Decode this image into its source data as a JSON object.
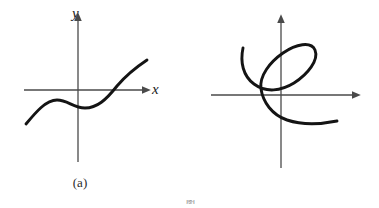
{
  "figure": {
    "background": "#ffffff",
    "ink_color": "#1a1a1a",
    "axis_color": "#4a4a4a",
    "width": 379,
    "height": 208,
    "bottom_caption_stub": "图"
  },
  "panels": [
    {
      "id": "a",
      "caption": "(a)",
      "x_axis_label": "x",
      "y_axis_label": "y",
      "description": "cubic-like increasing curve with one local maximum and one local minimum",
      "origin": {
        "x": 78,
        "y": 90
      },
      "x_axis": {
        "from_x": 24,
        "to_x": 148,
        "y": 90,
        "arrow": "right"
      },
      "y_axis": {
        "x": 78,
        "from_y": 162,
        "to_y": 15,
        "arrow": "up"
      },
      "curve_path": "M 26 124 C 36 112, 46 100, 57 100 C 68 100, 73 108, 85 108 C 97 108, 106 100, 117 86 C 128 73, 138 66, 147 60"
    },
    {
      "id": "b",
      "caption": "(b)",
      "x_axis_label": "x",
      "y_axis_label": "y",
      "description": "self-intersecting spiral loop curve, open at both ends",
      "origin": {
        "x": 281,
        "y": 95
      },
      "x_axis": {
        "from_x": 211,
        "to_x": 358,
        "y": 95,
        "arrow": "right"
      },
      "y_axis": {
        "x": 281,
        "from_y": 168,
        "to_y": 17,
        "arrow": "up"
      },
      "curve_path": "M 243 48 C 240 62, 243 76, 254 84 C 266 93, 281 91, 294 83 C 308 74, 319 60, 315 50 C 311 41, 296 44, 283 53 C 270 62, 259 76, 261 89 C 263 102, 272 115, 287 120 C 302 125, 322 124, 337 121"
    }
  ],
  "chart_data": {
    "type": "line",
    "title": "",
    "xlabel": "x",
    "ylabel": "y",
    "subplots": [
      {
        "label": "(a)",
        "curve_type": "cubic",
        "monotonic": false,
        "features": [
          "local maximum left of y-axis",
          "local minimum right of y-axis",
          "rises to upper right",
          "falls to lower left"
        ],
        "approx_points": [
          [
            -5.2,
            -3.4
          ],
          [
            -2.1,
            1.0
          ],
          [
            0.0,
            -1.6
          ],
          [
            0.7,
            -1.8
          ],
          [
            3.9,
            0.4
          ],
          [
            6.9,
            3.0
          ]
        ]
      },
      {
        "label": "(b)",
        "curve_type": "self-intersecting spiral",
        "monotonic": false,
        "features": [
          "tilted elliptical loop above x-axis",
          "two crossings of the y-axis",
          "open tail at upper left",
          "open tail at lower right"
        ],
        "approx_points": [
          [
            -3.8,
            4.7
          ],
          [
            -2.7,
            1.1
          ],
          [
            1.3,
            1.2
          ],
          [
            3.4,
            4.5
          ],
          [
            0.2,
            4.2
          ],
          [
            -2.0,
            0.6
          ],
          [
            0.6,
            -2.5
          ],
          [
            5.6,
            -2.6
          ]
        ]
      }
    ],
    "grid": false,
    "legend": false
  }
}
